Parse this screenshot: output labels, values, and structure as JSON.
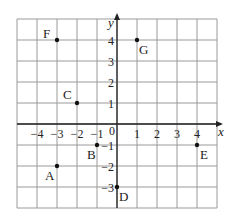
{
  "diagram": {
    "type": "coordinate-grid",
    "x_axis_label": "x",
    "y_axis_label": "y",
    "origin_label": "0",
    "x_range": [
      -5,
      5
    ],
    "y_range": [
      -4,
      5
    ],
    "x_ticks": [
      {
        "v": -4,
        "t": "−4"
      },
      {
        "v": -3,
        "t": "−3"
      },
      {
        "v": -2,
        "t": "−2"
      },
      {
        "v": -1,
        "t": "−1"
      },
      {
        "v": 1,
        "t": "1"
      },
      {
        "v": 2,
        "t": "2"
      },
      {
        "v": 3,
        "t": "3"
      },
      {
        "v": 4,
        "t": "4"
      }
    ],
    "y_ticks": [
      {
        "v": 4,
        "t": "4"
      },
      {
        "v": 3,
        "t": "3"
      },
      {
        "v": 2,
        "t": "2"
      },
      {
        "v": 1,
        "t": "1"
      },
      {
        "v": -1,
        "t": "−1"
      },
      {
        "v": -2,
        "t": "−2"
      },
      {
        "v": -3,
        "t": "−3"
      }
    ],
    "points": [
      {
        "name": "A",
        "x": -3,
        "y": -2,
        "lx": -12,
        "ly": 14
      },
      {
        "name": "B",
        "x": -1,
        "y": -1,
        "lx": -10,
        "ly": 14
      },
      {
        "name": "C",
        "x": -2,
        "y": 1,
        "lx": -14,
        "ly": -4
      },
      {
        "name": "D",
        "x": 0,
        "y": -3,
        "lx": 2,
        "ly": 14
      },
      {
        "name": "E",
        "x": 4,
        "y": -1,
        "lx": 3,
        "ly": 14
      },
      {
        "name": "F",
        "x": -3,
        "y": 4,
        "lx": -14,
        "ly": -2
      },
      {
        "name": "G",
        "x": 1,
        "y": 4,
        "lx": 2,
        "ly": 14
      }
    ],
    "colors": {
      "grid": "#9a9a9a",
      "axis": "#222222",
      "point": "#111111"
    }
  }
}
